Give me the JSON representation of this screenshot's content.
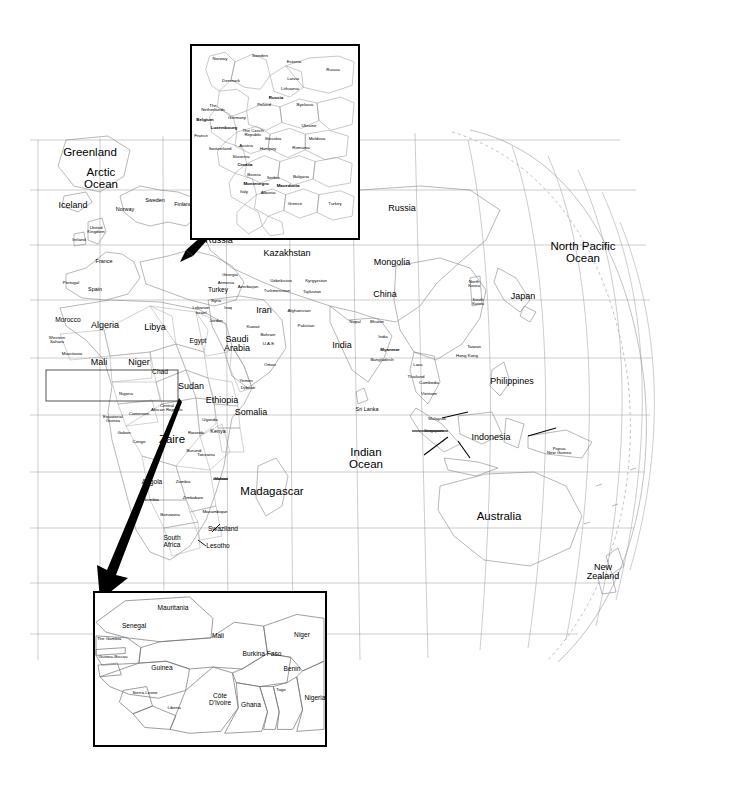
{
  "figure": {
    "type": "world-map-with-insets",
    "projection": "globe-orthographic-right-limb",
    "background_color": "#ffffff",
    "line_color": "#8a8a8a",
    "text_color": "#000000",
    "arrow_color": "#000000"
  },
  "main_map": {
    "ocean_labels": [
      {
        "text": "Arctic\nOcean",
        "x": 101,
        "y": 178,
        "size": "xl"
      },
      {
        "text": "North Pacific\nOcean",
        "x": 583,
        "y": 252,
        "size": "xl"
      },
      {
        "text": "Indian\nOcean",
        "x": 366,
        "y": 458,
        "size": "xl"
      }
    ],
    "labels": [
      {
        "text": "Greenland",
        "x": 90,
        "y": 153,
        "size": "xl"
      },
      {
        "text": "Iceland",
        "x": 73,
        "y": 205,
        "size": "lg"
      },
      {
        "text": "Norway",
        "x": 125,
        "y": 210,
        "size": "sm"
      },
      {
        "text": "Sweden",
        "x": 155,
        "y": 201,
        "size": "sm"
      },
      {
        "text": "Finland",
        "x": 183,
        "y": 205,
        "size": "sm"
      },
      {
        "text": "United\nKingdom",
        "x": 96,
        "y": 230,
        "size": "xs"
      },
      {
        "text": "Ireland",
        "x": 79,
        "y": 240,
        "size": "xs"
      },
      {
        "text": "France",
        "x": 104,
        "y": 262,
        "size": "sm"
      },
      {
        "text": "Portugal",
        "x": 71,
        "y": 283,
        "size": "xs"
      },
      {
        "text": "Spain",
        "x": 95,
        "y": 290,
        "size": "sm"
      },
      {
        "text": "Morocco",
        "x": 68,
        "y": 320,
        "size": "md"
      },
      {
        "text": "Algeria",
        "x": 105,
        "y": 325,
        "size": "lg"
      },
      {
        "text": "Libya",
        "x": 155,
        "y": 327,
        "size": "lg"
      },
      {
        "text": "Egypt",
        "x": 198,
        "y": 341,
        "size": "md"
      },
      {
        "text": "Western\nSahara",
        "x": 57,
        "y": 340,
        "size": "xs"
      },
      {
        "text": "Mauritania",
        "x": 72,
        "y": 354,
        "size": "xs"
      },
      {
        "text": "Mali",
        "x": 99,
        "y": 362,
        "size": "lg"
      },
      {
        "text": "Niger",
        "x": 139,
        "y": 362,
        "size": "lg"
      },
      {
        "text": "Chad",
        "x": 160,
        "y": 372,
        "size": "md"
      },
      {
        "text": "Sudan",
        "x": 191,
        "y": 386,
        "size": "lg"
      },
      {
        "text": "Nigeria",
        "x": 126,
        "y": 394,
        "size": "xs"
      },
      {
        "text": "Central\nAfrican Republic",
        "x": 167,
        "y": 408,
        "size": "xs"
      },
      {
        "text": "Cameroon",
        "x": 139,
        "y": 414,
        "size": "xs"
      },
      {
        "text": "Equatorial\nGuinea",
        "x": 113,
        "y": 419,
        "size": "xs"
      },
      {
        "text": "Gabon",
        "x": 124,
        "y": 433,
        "size": "xs"
      },
      {
        "text": "Congo",
        "x": 139,
        "y": 442,
        "size": "xs"
      },
      {
        "text": "Zaire",
        "x": 172,
        "y": 440,
        "size": "xl"
      },
      {
        "text": "Rwanda",
        "x": 196,
        "y": 433,
        "size": "xs"
      },
      {
        "text": "Burundi",
        "x": 194,
        "y": 451,
        "size": "xs"
      },
      {
        "text": "Uganda",
        "x": 210,
        "y": 420,
        "size": "xs"
      },
      {
        "text": "Kenya",
        "x": 218,
        "y": 432,
        "size": "sm"
      },
      {
        "text": "Ethiopia",
        "x": 222,
        "y": 400,
        "size": "lg"
      },
      {
        "text": "Somalia",
        "x": 251,
        "y": 412,
        "size": "lg"
      },
      {
        "text": "Tanzania",
        "x": 206,
        "y": 455,
        "size": "xs"
      },
      {
        "text": "Malawi",
        "x": 221,
        "y": 479,
        "size": "xs"
      },
      {
        "text": "Angola",
        "x": 152,
        "y": 482,
        "size": "md"
      },
      {
        "text": "Zambia",
        "x": 183,
        "y": 482,
        "size": "xs"
      },
      {
        "text": "Namibia",
        "x": 151,
        "y": 500,
        "size": "xs"
      },
      {
        "text": "Zimbabwe",
        "x": 193,
        "y": 498,
        "size": "xs"
      },
      {
        "text": "Botswana",
        "x": 170,
        "y": 515,
        "size": "xs"
      },
      {
        "text": "Mozambique",
        "x": 215,
        "y": 512,
        "size": "xs"
      },
      {
        "text": "Swaziland",
        "x": 223,
        "y": 529,
        "size": "md"
      },
      {
        "text": "South\nAfrica",
        "x": 172,
        "y": 542,
        "size": "md"
      },
      {
        "text": "Lesotho",
        "x": 218,
        "y": 546,
        "size": "md"
      },
      {
        "text": "Madagascar",
        "x": 272,
        "y": 492,
        "size": "xl"
      },
      {
        "text": "Russia",
        "x": 219,
        "y": 240,
        "size": "lg"
      },
      {
        "text": "Kazakhstan",
        "x": 287,
        "y": 253,
        "size": "lg"
      },
      {
        "text": "Russia",
        "x": 402,
        "y": 208,
        "size": "lg"
      },
      {
        "text": "Mongolia",
        "x": 392,
        "y": 262,
        "size": "lg"
      },
      {
        "text": "China",
        "x": 385,
        "y": 294,
        "size": "lg"
      },
      {
        "text": "North\nKorea",
        "x": 474,
        "y": 284,
        "size": "xs"
      },
      {
        "text": "South\nKorea",
        "x": 478,
        "y": 302,
        "size": "xs"
      },
      {
        "text": "Japan",
        "x": 523,
        "y": 296,
        "size": "lg"
      },
      {
        "text": "Turkey",
        "x": 218,
        "y": 290,
        "size": "md"
      },
      {
        "text": "Georgia",
        "x": 230,
        "y": 275,
        "size": "xs"
      },
      {
        "text": "Armenia",
        "x": 226,
        "y": 283,
        "size": "xs"
      },
      {
        "text": "Azerbaijan",
        "x": 248,
        "y": 287,
        "size": "xs"
      },
      {
        "text": "Syria",
        "x": 216,
        "y": 301,
        "size": "xs"
      },
      {
        "text": "Lebanon",
        "x": 201,
        "y": 308,
        "size": "xs"
      },
      {
        "text": "Israel",
        "x": 201,
        "y": 313,
        "size": "xs"
      },
      {
        "text": "Iraq",
        "x": 228,
        "y": 308,
        "size": "xs"
      },
      {
        "text": "Jordan",
        "x": 216,
        "y": 321,
        "size": "xs"
      },
      {
        "text": "Kuwait",
        "x": 253,
        "y": 327,
        "size": "xs"
      },
      {
        "text": "Saudi\nArabia",
        "x": 237,
        "y": 344,
        "size": "lg"
      },
      {
        "text": "Bahrain",
        "x": 268,
        "y": 335,
        "size": "xs"
      },
      {
        "text": "U.A.E.",
        "x": 269,
        "y": 344,
        "size": "xs"
      },
      {
        "text": "Oman",
        "x": 270,
        "y": 365,
        "size": "xs"
      },
      {
        "text": "Yemen",
        "x": 246,
        "y": 381,
        "size": "xs"
      },
      {
        "text": "Djibouti",
        "x": 248,
        "y": 388,
        "size": "xs"
      },
      {
        "text": "Iran",
        "x": 264,
        "y": 310,
        "size": "lg"
      },
      {
        "text": "Uzbekistan",
        "x": 281,
        "y": 281,
        "size": "xs"
      },
      {
        "text": "Kyrgyzstan",
        "x": 316,
        "y": 281,
        "size": "xs"
      },
      {
        "text": "Turkmenistan",
        "x": 277,
        "y": 291,
        "size": "xs"
      },
      {
        "text": "Tajikistan",
        "x": 312,
        "y": 292,
        "size": "xs"
      },
      {
        "text": "Afghanistan",
        "x": 299,
        "y": 311,
        "size": "xs"
      },
      {
        "text": "Pakistan",
        "x": 306,
        "y": 326,
        "size": "xs"
      },
      {
        "text": "Nepal",
        "x": 355,
        "y": 322,
        "size": "xs"
      },
      {
        "text": "Bhutan",
        "x": 377,
        "y": 322,
        "size": "xs"
      },
      {
        "text": "India",
        "x": 342,
        "y": 345,
        "size": "lg"
      },
      {
        "text": "India",
        "x": 383,
        "y": 337,
        "size": "xs"
      },
      {
        "text": "Myanmar",
        "x": 390,
        "y": 350,
        "size": "xs",
        "bold": true
      },
      {
        "text": "Bangladesh",
        "x": 382,
        "y": 360,
        "size": "xs"
      },
      {
        "text": "Laos",
        "x": 418,
        "y": 365,
        "size": "xs"
      },
      {
        "text": "Thailand",
        "x": 416,
        "y": 377,
        "size": "xs"
      },
      {
        "text": "Cambodia",
        "x": 429,
        "y": 383,
        "size": "xs"
      },
      {
        "text": "Vietnam",
        "x": 429,
        "y": 394,
        "size": "xs"
      },
      {
        "text": "Taiwan",
        "x": 474,
        "y": 347,
        "size": "xs"
      },
      {
        "text": "Hong Kong",
        "x": 467,
        "y": 356,
        "size": "xs"
      },
      {
        "text": "Philippines",
        "x": 512,
        "y": 381,
        "size": "lg"
      },
      {
        "text": "Sri Lanka",
        "x": 367,
        "y": 410,
        "size": "sm"
      },
      {
        "text": "Malaysia",
        "x": 437,
        "y": 419,
        "size": "xs"
      },
      {
        "text": "Singapore",
        "x": 434,
        "y": 431,
        "size": "xs"
      },
      {
        "text": "Indonesia",
        "x": 491,
        "y": 437,
        "size": "lg"
      },
      {
        "text": "Papua\nNew Guinea",
        "x": 559,
        "y": 451,
        "size": "xs"
      },
      {
        "text": "Australia",
        "x": 499,
        "y": 517,
        "size": "xl"
      },
      {
        "text": "New\nZealand",
        "x": 603,
        "y": 572,
        "size": "lg"
      }
    ]
  },
  "inset_europe": {
    "name": "Europe inset",
    "box": {
      "x": 190,
      "y": 44,
      "width": 170,
      "height": 196
    },
    "labels": [
      {
        "text": "Norway",
        "x": 218,
        "y": 57,
        "size": "xs"
      },
      {
        "text": "Sweden",
        "x": 258,
        "y": 54,
        "size": "xs"
      },
      {
        "text": "Estonia",
        "x": 292,
        "y": 60,
        "size": "xs"
      },
      {
        "text": "Russia",
        "x": 331,
        "y": 68,
        "size": "xs"
      },
      {
        "text": "Denmark",
        "x": 229,
        "y": 79,
        "size": "xs"
      },
      {
        "text": "Latvia",
        "x": 291,
        "y": 77,
        "size": "xs"
      },
      {
        "text": "Lithuania",
        "x": 288,
        "y": 87,
        "size": "xs"
      },
      {
        "text": "Russia",
        "x": 274,
        "y": 96,
        "size": "xs",
        "bold": true
      },
      {
        "text": "Poland",
        "x": 262,
        "y": 103,
        "size": "xs"
      },
      {
        "text": "Byelarus",
        "x": 303,
        "y": 103,
        "size": "xs"
      },
      {
        "text": "The\nNetherlands",
        "x": 211,
        "y": 106,
        "size": "xs"
      },
      {
        "text": "Germany",
        "x": 235,
        "y": 116,
        "size": "xs"
      },
      {
        "text": "Belgium",
        "x": 203,
        "y": 118,
        "size": "xs",
        "bold": true
      },
      {
        "text": "Luxembourg",
        "x": 222,
        "y": 126,
        "size": "xs",
        "bold": true
      },
      {
        "text": "Ukraine",
        "x": 307,
        "y": 124,
        "size": "xs"
      },
      {
        "text": "The Czech\nRepublic",
        "x": 251,
        "y": 131,
        "size": "xs"
      },
      {
        "text": "Slovakia",
        "x": 271,
        "y": 137,
        "size": "xs"
      },
      {
        "text": "France",
        "x": 199,
        "y": 134,
        "size": "xs"
      },
      {
        "text": "Moldova",
        "x": 315,
        "y": 137,
        "size": "xs"
      },
      {
        "text": "Austria",
        "x": 244,
        "y": 144,
        "size": "xs"
      },
      {
        "text": "Hungary",
        "x": 266,
        "y": 147,
        "size": "xs"
      },
      {
        "text": "Romania",
        "x": 299,
        "y": 146,
        "size": "xs"
      },
      {
        "text": "Switzerland",
        "x": 218,
        "y": 147,
        "size": "xs"
      },
      {
        "text": "Slovenia",
        "x": 239,
        "y": 155,
        "size": "xs"
      },
      {
        "text": "Croatia",
        "x": 243,
        "y": 163,
        "size": "xs",
        "bold": true
      },
      {
        "text": "Bosnia",
        "x": 252,
        "y": 173,
        "size": "xs"
      },
      {
        "text": "Serbia",
        "x": 271,
        "y": 176,
        "size": "xs"
      },
      {
        "text": "Bulgaria",
        "x": 299,
        "y": 175,
        "size": "xs"
      },
      {
        "text": "Montenegro",
        "x": 254,
        "y": 182,
        "size": "xs",
        "bold": true
      },
      {
        "text": "Macedonia",
        "x": 286,
        "y": 184,
        "size": "xs",
        "bold": true
      },
      {
        "text": "Italy",
        "x": 242,
        "y": 190,
        "size": "xs"
      },
      {
        "text": "Albania",
        "x": 266,
        "y": 191,
        "size": "xs"
      },
      {
        "text": "Greece",
        "x": 293,
        "y": 202,
        "size": "xs"
      },
      {
        "text": "Turkey",
        "x": 333,
        "y": 202,
        "size": "xs"
      }
    ],
    "arrow": {
      "from": {
        "x": 190,
        "y": 246
      },
      "to": {
        "x": 241,
        "y": 200
      }
    }
  },
  "inset_africa": {
    "name": "West Africa inset",
    "box": {
      "x": 93,
      "y": 591,
      "width": 234,
      "height": 156
    },
    "labels": [
      {
        "text": "Mauritania",
        "x": 171,
        "y": 606,
        "size": "md"
      },
      {
        "text": "Senegal",
        "x": 132,
        "y": 624,
        "size": "md"
      },
      {
        "text": "The Gambia",
        "x": 107,
        "y": 637,
        "size": "xs"
      },
      {
        "text": "Guinea-Bissau",
        "x": 111,
        "y": 655,
        "size": "xs"
      },
      {
        "text": "Guinea",
        "x": 160,
        "y": 666,
        "size": "md"
      },
      {
        "text": "Sierra Leone",
        "x": 143,
        "y": 691,
        "size": "xs"
      },
      {
        "text": "Liberia",
        "x": 172,
        "y": 706,
        "size": "xs"
      },
      {
        "text": "Mali",
        "x": 216,
        "y": 634,
        "size": "md"
      },
      {
        "text": "Burkina Faso",
        "x": 260,
        "y": 652,
        "size": "md"
      },
      {
        "text": "Niger",
        "x": 300,
        "y": 633,
        "size": "md"
      },
      {
        "text": "Benin",
        "x": 290,
        "y": 667,
        "size": "md"
      },
      {
        "text": "Togo",
        "x": 279,
        "y": 688,
        "size": "xs"
      },
      {
        "text": "Nigeria",
        "x": 313,
        "y": 696,
        "size": "md"
      },
      {
        "text": "Ghana",
        "x": 249,
        "y": 703,
        "size": "md"
      },
      {
        "text": "Côte\nD'Ivoire",
        "x": 218,
        "y": 698,
        "size": "md"
      }
    ],
    "arrow": {
      "from": {
        "x": 178,
        "y": 400
      },
      "to": {
        "x": 103,
        "y": 597
      }
    },
    "selection_rect": {
      "x": 46,
      "y": 370,
      "width": 132,
      "height": 31
    }
  }
}
